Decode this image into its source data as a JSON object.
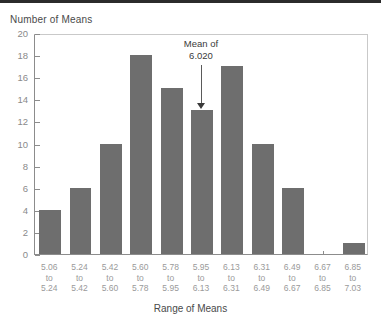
{
  "axes": {
    "y_title": "Number of Means",
    "x_title": "Range of Means"
  },
  "annotation": {
    "line1": "Mean of",
    "line2": "6.020"
  },
  "colors": {
    "bar": "#6e6e6e",
    "axis": "#8c8c8c",
    "tick_label": "#8a8a8a",
    "x_tick_label": "#9a9a9a",
    "title_text": "#4a4a4a",
    "top_band": "#2b2b2b",
    "background": "#ffffff"
  },
  "chart_data": {
    "type": "bar",
    "title": "",
    "xlabel": "Range of Means",
    "ylabel": "Number of Means",
    "ylim": [
      0,
      20
    ],
    "ytick_values": [
      0,
      2,
      4,
      6,
      8,
      10,
      12,
      14,
      16,
      18,
      20
    ],
    "ytick_labels": [
      "0",
      "2",
      "4",
      "6",
      "8",
      "10",
      "12",
      "14",
      "16",
      "18",
      "20"
    ],
    "grid": false,
    "legend": null,
    "categories": [
      "5.06\nto\n5.24",
      "5.24\nto\n5.42",
      "5.42\nto\n5.60",
      "5.60\nto\n5.78",
      "5.78\nto\n5.95",
      "5.95\nto\n6.13",
      "6.13\nto\n6.31",
      "6.31\nto\n6.49",
      "6.49\nto\n6.67",
      "6.67\nto\n6.85",
      "6.85\nto\n7.03"
    ],
    "bin_edges_lower": [
      "5.06",
      "5.24",
      "5.42",
      "5.60",
      "5.78",
      "5.95",
      "6.13",
      "6.31",
      "6.49",
      "6.67",
      "6.85"
    ],
    "bin_edges_upper": [
      "5.24",
      "5.42",
      "5.60",
      "5.78",
      "5.95",
      "6.13",
      "6.31",
      "6.49",
      "6.67",
      "6.85",
      "7.03"
    ],
    "connector_label": "to",
    "values": [
      4,
      6,
      10,
      18,
      15,
      13,
      17,
      10,
      6,
      0,
      1
    ],
    "annotations": [
      {
        "text": "Mean of 6.020",
        "value": "6.020",
        "points_to_category_index": 5
      }
    ]
  }
}
